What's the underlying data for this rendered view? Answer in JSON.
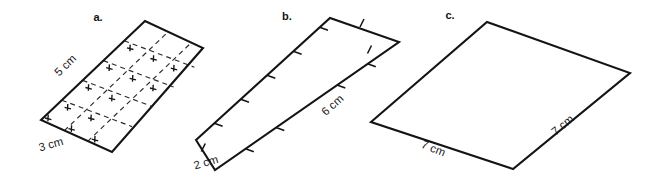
{
  "page": {
    "background_color": "#ffffff",
    "stroke_color": "#141414",
    "grid_color": "#2b2b2b",
    "width": 657,
    "height": 178
  },
  "figures": [
    {
      "id": "figure-a",
      "label": "a.",
      "label_x": 98,
      "label_y": 21,
      "shape": "parallelogram",
      "vertices": [
        [
          41,
          120
        ],
        [
          145,
          21
        ],
        [
          203,
          48
        ],
        [
          112,
          152
        ]
      ],
      "has_grid": true,
      "grid_rows": 3,
      "grid_cols": 5,
      "has_edge_ticks": false,
      "dimensions": [
        {
          "name": "slant-side",
          "text": "5 cm",
          "x": 68,
          "y": 68,
          "rotation": -44
        },
        {
          "name": "base-side",
          "text": "3 cm",
          "x": 52,
          "y": 148,
          "rotation": -16
        }
      ]
    },
    {
      "id": "figure-b",
      "label": "b.",
      "label_x": 287,
      "label_y": 20,
      "shape": "parallelogram",
      "vertices": [
        [
          196,
          140
        ],
        [
          330,
          18
        ],
        [
          399,
          42
        ],
        [
          215,
          170
        ]
      ],
      "has_grid": false,
      "has_edge_ticks": true,
      "ticks_long_edge": 6,
      "ticks_short_edge": 2,
      "dimensions": [
        {
          "name": "short-side",
          "text": "2 cm",
          "x": 186,
          "y": 166,
          "rotation": -16
        },
        {
          "name": "long-side",
          "text": "6 cm",
          "x": 323,
          "y": 112,
          "rotation": -42
        }
      ]
    },
    {
      "id": "figure-c",
      "label": "c.",
      "label_x": 450,
      "label_y": 19,
      "shape": "parallelogram",
      "vertices": [
        [
          371,
          122
        ],
        [
          487,
          22
        ],
        [
          630,
          73
        ],
        [
          513,
          169
        ]
      ],
      "has_grid": false,
      "has_edge_ticks": false,
      "dimensions": [
        {
          "name": "bottom-left-side",
          "text": "7 cm",
          "x": 419,
          "y": 152,
          "rotation": 22
        },
        {
          "name": "bottom-right-side",
          "text": "7 cm",
          "x": 553,
          "y": 133,
          "rotation": -40
        }
      ]
    }
  ]
}
